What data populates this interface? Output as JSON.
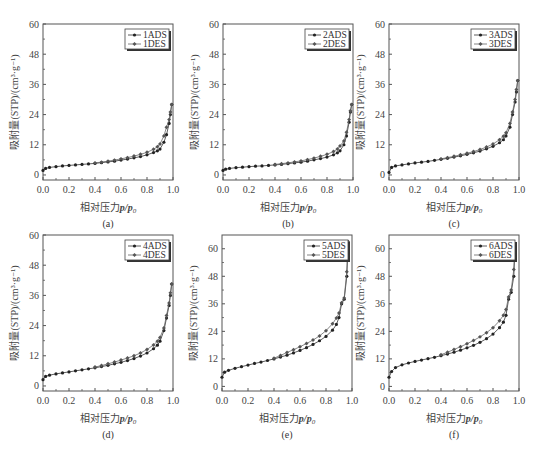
{
  "figure": {
    "xlabel": "相对压力p/p0",
    "xlabel_prefix": "相对压力",
    "ylabel": "吸附量(STP)/(cm³·g⁻¹)",
    "x_ticks": [
      "0.0",
      "0.2",
      "0.4",
      "0.6",
      "0.8",
      "1.0"
    ]
  },
  "chart_data": [
    {
      "type": "line",
      "panel": "(a)",
      "xlabel": "相对压力p/p0",
      "ylabel": "吸附量(STP)/(cm³·g⁻¹)",
      "xlim": [
        0,
        1.0
      ],
      "ylim": [
        -2,
        60
      ],
      "y_ticks": [
        0,
        12,
        24,
        36,
        48,
        60
      ],
      "legend": [
        "1ADS",
        "1DES"
      ],
      "legend_position": "upper right",
      "x": [
        0.0,
        0.02,
        0.05,
        0.1,
        0.15,
        0.2,
        0.25,
        0.3,
        0.35,
        0.4,
        0.45,
        0.5,
        0.55,
        0.6,
        0.65,
        0.7,
        0.75,
        0.8,
        0.85,
        0.88,
        0.9,
        0.93,
        0.95,
        0.97,
        0.98,
        0.99
      ],
      "series": [
        {
          "name": "1ADS",
          "values": [
            1.8,
            2.6,
            3.0,
            3.3,
            3.6,
            3.8,
            4.0,
            4.2,
            4.4,
            4.6,
            4.9,
            5.2,
            5.5,
            5.9,
            6.3,
            6.8,
            7.3,
            8.0,
            8.9,
            9.6,
            10.3,
            13.0,
            16.0,
            20.5,
            24.0,
            28.0
          ]
        },
        {
          "name": "1DES",
          "values": [
            null,
            null,
            null,
            null,
            null,
            null,
            null,
            null,
            null,
            4.8,
            5.1,
            5.5,
            5.9,
            6.4,
            6.9,
            7.5,
            8.2,
            9.0,
            10.2,
            11.2,
            12.3,
            15.5,
            19.0,
            22.0,
            25.0,
            28.0
          ]
        }
      ]
    },
    {
      "type": "line",
      "panel": "(b)",
      "xlabel": "相对压力p/p0",
      "ylabel": "吸附量(STP)/(cm³·g⁻¹)",
      "xlim": [
        0,
        1.0
      ],
      "ylim": [
        -2,
        60
      ],
      "y_ticks": [
        0,
        12,
        24,
        36,
        48,
        60
      ],
      "legend": [
        "2ADS",
        "2DES"
      ],
      "legend_position": "upper right",
      "x": [
        0.0,
        0.02,
        0.05,
        0.1,
        0.15,
        0.2,
        0.25,
        0.3,
        0.35,
        0.4,
        0.45,
        0.5,
        0.55,
        0.6,
        0.65,
        0.7,
        0.75,
        0.8,
        0.85,
        0.88,
        0.9,
        0.93,
        0.95,
        0.97,
        0.98,
        0.99
      ],
      "series": [
        {
          "name": "2ADS",
          "values": [
            1.8,
            2.3,
            2.6,
            2.9,
            3.1,
            3.3,
            3.5,
            3.6,
            3.8,
            4.0,
            4.2,
            4.5,
            4.8,
            5.1,
            5.5,
            6.0,
            6.5,
            7.1,
            8.0,
            8.8,
            9.6,
            12.0,
            15.5,
            21.0,
            25.0,
            28.0
          ]
        },
        {
          "name": "2DES",
          "values": [
            null,
            null,
            null,
            null,
            null,
            null,
            null,
            null,
            null,
            4.2,
            4.5,
            4.8,
            5.2,
            5.6,
            6.1,
            6.7,
            7.4,
            8.2,
            9.3,
            10.3,
            11.5,
            13.5,
            17.0,
            22.0,
            25.5,
            28.0
          ]
        }
      ]
    },
    {
      "type": "line",
      "panel": "(c)",
      "xlabel": "相对压力p/p0",
      "ylabel": "吸附量(STP)/(cm³·g⁻¹)",
      "xlim": [
        0,
        1.0
      ],
      "ylim": [
        -2,
        60
      ],
      "y_ticks": [
        0,
        12,
        24,
        36,
        48,
        60
      ],
      "legend": [
        "3ADS",
        "3DES"
      ],
      "legend_position": "upper right",
      "x": [
        0.0,
        0.02,
        0.05,
        0.1,
        0.15,
        0.2,
        0.25,
        0.3,
        0.35,
        0.4,
        0.45,
        0.5,
        0.55,
        0.6,
        0.65,
        0.7,
        0.75,
        0.8,
        0.85,
        0.88,
        0.9,
        0.93,
        0.95,
        0.97,
        0.98,
        0.99
      ],
      "series": [
        {
          "name": "3ADS",
          "values": [
            1.0,
            3.0,
            3.6,
            4.0,
            4.4,
            4.8,
            5.1,
            5.4,
            5.8,
            6.2,
            6.6,
            7.1,
            7.6,
            8.2,
            8.8,
            9.5,
            10.4,
            11.4,
            12.8,
            14.0,
            15.5,
            19.0,
            24.0,
            29.0,
            33.0,
            37.5
          ]
        },
        {
          "name": "3DES",
          "values": [
            null,
            null,
            null,
            null,
            null,
            null,
            null,
            null,
            null,
            6.4,
            6.9,
            7.4,
            8.0,
            8.6,
            9.3,
            10.1,
            11.1,
            12.3,
            14.0,
            15.4,
            16.8,
            20.5,
            25.0,
            30.0,
            34.0,
            37.5
          ]
        }
      ]
    },
    {
      "type": "line",
      "panel": "(d)",
      "xlabel": "相对压力p/p0",
      "ylabel": "吸附量(STP)/(cm³·g⁻¹)",
      "xlim": [
        0,
        1.0
      ],
      "ylim": [
        -2,
        60
      ],
      "y_ticks": [
        0,
        12,
        24,
        36,
        48,
        60
      ],
      "legend": [
        "4ADS",
        "4DES"
      ],
      "legend_position": "upper right",
      "x": [
        0.0,
        0.02,
        0.05,
        0.1,
        0.15,
        0.2,
        0.25,
        0.3,
        0.35,
        0.4,
        0.45,
        0.5,
        0.55,
        0.6,
        0.65,
        0.7,
        0.75,
        0.8,
        0.85,
        0.88,
        0.9,
        0.93,
        0.95,
        0.97,
        0.98,
        0.99
      ],
      "series": [
        {
          "name": "4ADS",
          "values": [
            2.5,
            3.8,
            4.3,
            4.8,
            5.2,
            5.6,
            6.0,
            6.4,
            6.8,
            7.2,
            7.7,
            8.2,
            8.8,
            9.4,
            10.1,
            10.9,
            11.9,
            13.1,
            14.8,
            16.2,
            17.8,
            22.0,
            27.0,
            32.0,
            36.0,
            40.5
          ]
        },
        {
          "name": "4DES",
          "values": [
            null,
            null,
            null,
            null,
            null,
            null,
            null,
            null,
            null,
            7.5,
            8.1,
            8.8,
            9.5,
            10.3,
            11.1,
            12.0,
            13.1,
            14.5,
            16.3,
            17.8,
            19.3,
            23.0,
            28.0,
            33.0,
            37.0,
            40.5
          ]
        }
      ]
    },
    {
      "type": "line",
      "panel": "(e)",
      "xlabel": "相对压力p/p0",
      "ylabel": "吸附量(STP)/(cm³·g⁻¹)",
      "xlim": [
        0,
        1.0
      ],
      "ylim": [
        -2,
        66
      ],
      "y_ticks": [
        0,
        12,
        24,
        36,
        48,
        60
      ],
      "legend": [
        "5ADS",
        "5DES"
      ],
      "legend_position": "upper right",
      "x": [
        0.0,
        0.02,
        0.05,
        0.1,
        0.15,
        0.2,
        0.25,
        0.3,
        0.35,
        0.4,
        0.45,
        0.5,
        0.55,
        0.6,
        0.65,
        0.7,
        0.75,
        0.8,
        0.85,
        0.88,
        0.9,
        0.92,
        0.94,
        0.96,
        0.97
      ],
      "series": [
        {
          "name": "5ADS",
          "values": [
            4.0,
            6.2,
            7.0,
            7.9,
            8.6,
            9.3,
            10.0,
            10.6,
            11.3,
            12.0,
            12.8,
            13.6,
            14.6,
            15.7,
            16.9,
            18.3,
            19.9,
            21.8,
            24.5,
            27.0,
            30.0,
            36.0,
            38.0,
            48.0,
            63.0
          ]
        },
        {
          "name": "5DES",
          "values": [
            null,
            null,
            null,
            null,
            null,
            null,
            null,
            null,
            null,
            12.3,
            13.5,
            14.8,
            16.0,
            17.3,
            18.7,
            20.2,
            22.0,
            24.3,
            27.3,
            29.8,
            32.0,
            36.5,
            38.5,
            50.0,
            63.0
          ]
        }
      ]
    },
    {
      "type": "line",
      "panel": "(f)",
      "xlabel": "相对压力p/p0",
      "ylabel": "吸附量(STP)/(cm³·g⁻¹)",
      "xlim": [
        0,
        1.0
      ],
      "ylim": [
        -2,
        66
      ],
      "y_ticks": [
        0,
        12,
        24,
        36,
        48,
        60
      ],
      "legend": [
        "6ADS",
        "6DES"
      ],
      "legend_position": "upper right",
      "x": [
        0.0,
        0.02,
        0.05,
        0.1,
        0.15,
        0.2,
        0.25,
        0.3,
        0.35,
        0.4,
        0.45,
        0.5,
        0.55,
        0.6,
        0.65,
        0.7,
        0.75,
        0.8,
        0.85,
        0.88,
        0.9,
        0.92,
        0.94,
        0.96,
        0.97
      ],
      "series": [
        {
          "name": "6ADS",
          "values": [
            4.0,
            6.5,
            8.2,
            9.4,
            10.2,
            10.9,
            11.5,
            12.1,
            12.7,
            13.4,
            14.1,
            14.9,
            15.8,
            16.8,
            17.9,
            19.2,
            20.8,
            22.8,
            25.6,
            28.0,
            31.0,
            38.0,
            41.0,
            48.0,
            62.0
          ]
        },
        {
          "name": "6DES",
          "values": [
            null,
            null,
            null,
            null,
            null,
            null,
            null,
            null,
            null,
            13.8,
            14.9,
            16.1,
            17.3,
            18.6,
            20.0,
            21.6,
            23.4,
            25.6,
            28.6,
            31.0,
            33.5,
            39.0,
            42.0,
            51.0,
            62.0
          ]
        }
      ]
    }
  ]
}
